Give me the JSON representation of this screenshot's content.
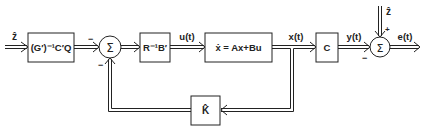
{
  "diagram": {
    "input_label": "ẑ",
    "blocks": {
      "precompensator": "(G′)⁻¹C′Q",
      "gain": "R⁻¹B′",
      "plant": "ẋ = Ax+Bu",
      "output_matrix": "C",
      "feedback_gain": "K̂"
    },
    "signals": {
      "u": "u(t)",
      "x": "x(t)",
      "y": "y(t)",
      "e": "e(t)",
      "z_ref": "ẑ"
    },
    "summers": {
      "sum1": {
        "symbol": "Σ",
        "sign_top": "−",
        "sign_bottom": "−"
      },
      "sum2": {
        "symbol": "Σ",
        "sign_top": "+",
        "sign_bottom": "−"
      }
    },
    "colors": {
      "line": "#222222",
      "background": "#ffffff"
    }
  }
}
